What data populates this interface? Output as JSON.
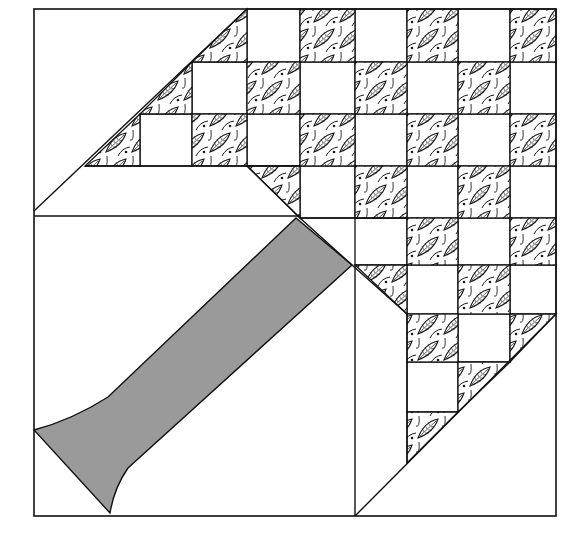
{
  "figure": {
    "colors": {
      "background": "#ffffff",
      "line": "#111111",
      "trunk": "#9a9a9a",
      "leaf_fill": "#ffffff",
      "leaf_ink": "#1a1a1a"
    },
    "border": {
      "x": 34,
      "y": 9,
      "w": 522,
      "h": 507
    },
    "grid_cols": [
      34,
      140,
      192,
      247,
      300,
      355,
      407,
      458,
      510,
      556
    ],
    "grid_rows": [
      9,
      62,
      114,
      166,
      218,
      265,
      314,
      362,
      412,
      463,
      516
    ],
    "leaf_squares": [
      [
        300,
        9,
        55,
        53
      ],
      [
        407,
        9,
        51,
        53
      ],
      [
        510,
        9,
        46,
        53
      ],
      [
        247,
        62,
        53,
        52
      ],
      [
        355,
        62,
        52,
        52
      ],
      [
        458,
        62,
        52,
        52
      ],
      [
        192,
        114,
        55,
        52
      ],
      [
        300,
        114,
        55,
        52
      ],
      [
        407,
        114,
        51,
        52
      ],
      [
        510,
        114,
        46,
        52
      ],
      [
        355,
        166,
        52,
        52
      ],
      [
        458,
        166,
        52,
        52
      ],
      [
        407,
        218,
        51,
        47
      ],
      [
        510,
        218,
        46,
        47
      ],
      [
        458,
        265,
        52,
        49
      ],
      [
        407,
        314,
        51,
        48
      ]
    ],
    "leaf_triangles": [
      "247,9 247,62 192,62",
      "192,62 192,114 140,114",
      "140,114 140,166 85,166",
      "247,166 300,166 300,218",
      "355,265 407,265 407,314",
      "510,314 556,314 510,362",
      "458,362 510,362 458,412",
      "407,412 458,412 407,463"
    ],
    "white_squares": [
      [
        247,
        9,
        53,
        53
      ],
      [
        355,
        9,
        52,
        53
      ],
      [
        458,
        9,
        52,
        53
      ],
      [
        192,
        62,
        55,
        52
      ],
      [
        300,
        62,
        55,
        52
      ],
      [
        407,
        62,
        51,
        52
      ],
      [
        510,
        62,
        46,
        52
      ],
      [
        140,
        114,
        52,
        52
      ],
      [
        247,
        114,
        53,
        52
      ],
      [
        355,
        114,
        52,
        52
      ],
      [
        458,
        114,
        52,
        52
      ],
      [
        300,
        166,
        55,
        52
      ],
      [
        407,
        166,
        51,
        52
      ],
      [
        510,
        166,
        46,
        52
      ],
      [
        355,
        218,
        52,
        47
      ],
      [
        458,
        218,
        52,
        47
      ],
      [
        407,
        265,
        51,
        49
      ],
      [
        510,
        265,
        46,
        49
      ],
      [
        458,
        314,
        52,
        48
      ],
      [
        407,
        362,
        51,
        50
      ]
    ],
    "lines": [
      "34,211 247,9",
      "85,166 300,166",
      "34,216 300,216",
      "300,218 407,218",
      "247,166 300,218",
      "300,218 352,265",
      "352,265 407,314",
      "355,265 355,516",
      "407,314 407,463",
      "556,314 355,516"
    ],
    "trunk_path": "M296,218 L352,265 L128,468 Q114,488 110,513 L34,430 Q72,420 108,397 Z",
    "caption": ""
  }
}
